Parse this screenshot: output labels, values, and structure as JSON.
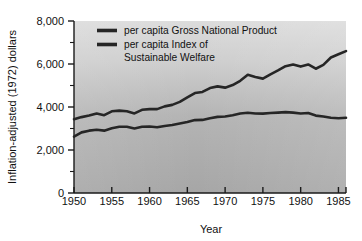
{
  "chart_data": {
    "type": "line",
    "title": "",
    "xlabel": "Year",
    "ylabel": "Inflation-adjusted (1972) dollars",
    "xlim": [
      1950,
      1986
    ],
    "ylim": [
      0,
      8000
    ],
    "xticks": [
      1950,
      1955,
      1960,
      1965,
      1970,
      1975,
      1980,
      1985
    ],
    "xtick_labels": [
      "1950",
      "1955",
      "1960",
      "1965",
      "1970",
      "1975",
      "1980",
      "1985"
    ],
    "yticks": [
      0,
      2000,
      4000,
      6000,
      8000
    ],
    "ytick_labels": [
      "0",
      "2,000",
      "4,000",
      "6,000",
      "8,000"
    ],
    "yminorticks": [
      1000,
      3000,
      5000,
      7000
    ],
    "grid": false,
    "legend_position": "top-left-inside",
    "x": [
      1950,
      1951,
      1952,
      1953,
      1954,
      1955,
      1956,
      1957,
      1958,
      1959,
      1960,
      1961,
      1962,
      1963,
      1964,
      1965,
      1966,
      1967,
      1968,
      1969,
      1970,
      1971,
      1972,
      1973,
      1974,
      1975,
      1976,
      1977,
      1978,
      1979,
      1980,
      1981,
      1982,
      1983,
      1984,
      1985,
      1986
    ],
    "series": [
      {
        "name": "per capita Gross National Product",
        "color": "#262626",
        "values": [
          3430,
          3530,
          3600,
          3700,
          3620,
          3800,
          3830,
          3800,
          3700,
          3870,
          3900,
          3900,
          4030,
          4100,
          4240,
          4450,
          4650,
          4700,
          4880,
          4960,
          4900,
          5020,
          5220,
          5500,
          5400,
          5320,
          5520,
          5700,
          5900,
          5980,
          5880,
          5980,
          5780,
          5960,
          6300,
          6450,
          6600
        ]
      },
      {
        "name": "per capita Index of Sustainable Welfare",
        "color": "#262626",
        "values": [
          2620,
          2820,
          2900,
          2940,
          2900,
          3010,
          3080,
          3080,
          3000,
          3080,
          3090,
          3060,
          3120,
          3160,
          3230,
          3300,
          3390,
          3400,
          3480,
          3540,
          3560,
          3620,
          3700,
          3730,
          3700,
          3690,
          3720,
          3740,
          3760,
          3740,
          3700,
          3720,
          3600,
          3560,
          3500,
          3480,
          3500
        ]
      }
    ],
    "legend_entries": [
      {
        "label_line1": "per capita Gross National Product",
        "label_line2": ""
      },
      {
        "label_line1": "per capita Index of",
        "label_line2": "Sustainable Welfare"
      }
    ]
  },
  "figure": {
    "background_color": "#ffffff",
    "plot_gradient_top": "#d6d6d6",
    "plot_gradient_bottom": "#a9a9a9",
    "axis_color": "#1a1a1a",
    "line_color": "#262626"
  }
}
